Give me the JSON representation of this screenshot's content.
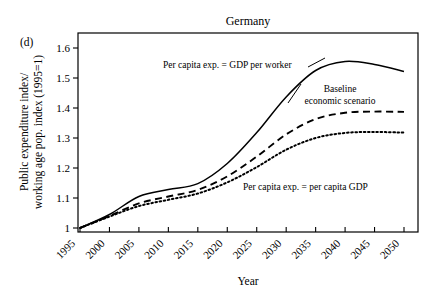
{
  "figure": {
    "panel_label": "(d)",
    "title": "Germany"
  },
  "axes": {
    "x_title": "Year",
    "y_title_line1": "Public expenditure index/",
    "y_title_line2": "working age pop. index (1995=1)",
    "y_ticks": [
      "1",
      "1.1",
      "1.2",
      "1.3",
      "1.4",
      "1.5",
      "1.6"
    ],
    "x_ticks": [
      "1995",
      "2000",
      "2005",
      "2010",
      "2015",
      "2020",
      "2025",
      "2030",
      "2035",
      "2040",
      "2045",
      "2050"
    ]
  },
  "annotations": {
    "solid": "Per capita exp. = GDP per worker",
    "dashed_line1": "Baseline",
    "dashed_line2": "economic scenario",
    "dotted": "Per capita exp. = per capita GDP"
  },
  "chart_data": {
    "type": "line",
    "title": "Germany",
    "xlabel": "Year",
    "ylabel": "Public expenditure index/ working age pop. index (1995=1)",
    "xlim": [
      1995,
      2050
    ],
    "ylim": [
      0.98,
      1.65
    ],
    "grid": false,
    "legend": "annotations-inline",
    "x": [
      1995,
      2000,
      2005,
      2010,
      2015,
      2020,
      2025,
      2030,
      2035,
      2040,
      2045,
      2050
    ],
    "series": [
      {
        "name": "Per capita exp. = GDP per worker",
        "style": "solid",
        "color": "#000000",
        "values": [
          1.0,
          1.045,
          1.105,
          1.128,
          1.148,
          1.215,
          1.318,
          1.437,
          1.525,
          1.555,
          1.545,
          1.522
        ]
      },
      {
        "name": "Baseline economic scenario",
        "style": "dashed",
        "color": "#000000",
        "values": [
          1.0,
          1.04,
          1.082,
          1.105,
          1.127,
          1.172,
          1.238,
          1.312,
          1.363,
          1.384,
          1.388,
          1.387
        ]
      },
      {
        "name": "Per capita exp. = per capita GDP",
        "style": "dotted",
        "color": "#000000",
        "values": [
          1.0,
          1.038,
          1.073,
          1.094,
          1.115,
          1.152,
          1.203,
          1.261,
          1.3,
          1.317,
          1.32,
          1.318
        ]
      }
    ]
  }
}
